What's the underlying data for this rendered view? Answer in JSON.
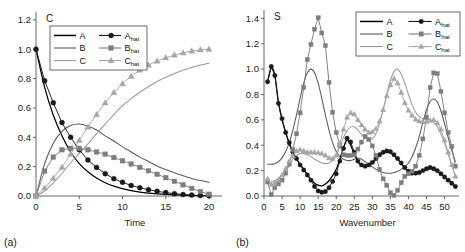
{
  "figure": {
    "panels": [
      {
        "id": "a",
        "corner_label": "(a)",
        "axis_letter": "C",
        "xlabel": "Time",
        "ylabel": "",
        "xticks": [
          "0",
          "5",
          "10",
          "15",
          "20"
        ],
        "yticks": [
          "0.0",
          "0.2",
          "0.4",
          "0.6",
          "0.8",
          "1.0",
          "1.2"
        ],
        "legend": [
          "A",
          "B",
          "C",
          "A_hat",
          "B_hat",
          "C_hat"
        ]
      },
      {
        "id": "b",
        "corner_label": "(b)",
        "axis_letter": "S",
        "xlabel": "Wavenumber",
        "ylabel": "",
        "xticks": [
          "0",
          "5",
          "10",
          "15",
          "20",
          "25",
          "30",
          "35",
          "40",
          "45",
          "50"
        ],
        "yticks": [
          "0.0",
          "0.2",
          "0.4",
          "0.6",
          "0.8",
          "1.0",
          "1.2",
          "1.4"
        ],
        "legend": [
          "A",
          "B",
          "C",
          "A_hat",
          "B_hat",
          "C_hat"
        ]
      }
    ],
    "legend_labels": {
      "a": "A",
      "b": "B",
      "c": "C",
      "ahat_base": "A",
      "bhat_base": "B",
      "chat_base": "C",
      "hat_sub": "hat"
    },
    "colors": {
      "A": "#000000",
      "B": "#5a5a5a",
      "C": "#9a9a9a",
      "Ahat": "#1a1a1a",
      "Bhat": "#7d7d7d",
      "Chat": "#a6a6a6",
      "axis": "#555555",
      "text": "#1a1a1a",
      "background": "#ffffff"
    }
  },
  "chart_data": [
    {
      "type": "line",
      "panel": "a",
      "title": "",
      "subtitle": "",
      "xlabel": "Time",
      "ylabel": "C",
      "xlim": [
        0,
        21.5
      ],
      "ylim": [
        0.0,
        1.24
      ],
      "xticks": [
        0,
        5,
        10,
        15,
        20
      ],
      "yticks": [
        0.0,
        0.2,
        0.4,
        0.6,
        0.8,
        1.0,
        1.2
      ],
      "grid": false,
      "legend_position": "top-center",
      "x": [
        0,
        1,
        2,
        3,
        4,
        5,
        6,
        7,
        8,
        9,
        10,
        11,
        12,
        13,
        14,
        15,
        16,
        17,
        18,
        19,
        20
      ],
      "series": [
        {
          "name": "A",
          "style": "line",
          "color": "#000000",
          "values": [
            1.0,
            0.74,
            0.55,
            0.41,
            0.3,
            0.22,
            0.165,
            0.122,
            0.09,
            0.067,
            0.05,
            0.037,
            0.027,
            0.02,
            0.015,
            0.011,
            0.008,
            0.006,
            0.004,
            0.003,
            0.002
          ]
        },
        {
          "name": "B",
          "style": "line",
          "color": "#5a5a5a",
          "values": [
            0.0,
            0.22,
            0.36,
            0.44,
            0.48,
            0.49,
            0.475,
            0.45,
            0.41,
            0.375,
            0.335,
            0.3,
            0.265,
            0.235,
            0.205,
            0.18,
            0.158,
            0.138,
            0.12,
            0.105,
            0.093
          ]
        },
        {
          "name": "C",
          "style": "line",
          "color": "#9a9a9a",
          "values": [
            0.0,
            0.035,
            0.09,
            0.155,
            0.225,
            0.29,
            0.355,
            0.425,
            0.49,
            0.555,
            0.615,
            0.663,
            0.707,
            0.745,
            0.78,
            0.809,
            0.834,
            0.856,
            0.876,
            0.892,
            0.905
          ]
        },
        {
          "name": "A_hat",
          "style": "line+marker",
          "marker": "circle",
          "color": "#1a1a1a",
          "values": [
            1.0,
            0.785,
            0.635,
            0.5,
            0.4,
            0.315,
            0.245,
            0.195,
            0.152,
            0.118,
            0.093,
            0.072,
            0.056,
            0.043,
            0.032,
            0.023,
            0.016,
            0.01,
            0.006,
            0.003,
            0.002
          ]
        },
        {
          "name": "B_hat",
          "style": "line+marker",
          "marker": "square",
          "color": "#7d7d7d",
          "values": [
            0.0,
            0.17,
            0.265,
            0.315,
            0.325,
            0.325,
            0.315,
            0.3,
            0.285,
            0.262,
            0.24,
            0.218,
            0.195,
            0.172,
            0.148,
            0.125,
            0.1,
            0.076,
            0.052,
            0.03,
            0.012
          ]
        },
        {
          "name": "C_hat",
          "style": "line+marker",
          "marker": "triangle",
          "color": "#a6a6a6",
          "values": [
            0.0,
            0.055,
            0.12,
            0.195,
            0.285,
            0.38,
            0.47,
            0.555,
            0.635,
            0.705,
            0.765,
            0.815,
            0.858,
            0.892,
            0.92,
            0.942,
            0.96,
            0.975,
            0.988,
            0.996,
            1.0
          ]
        }
      ]
    },
    {
      "type": "line",
      "panel": "b",
      "title": "",
      "subtitle": "",
      "xlabel": "Wavenumber",
      "ylabel": "S",
      "xlim": [
        0,
        54
      ],
      "ylim": [
        0.0,
        1.45
      ],
      "xticks": [
        0,
        5,
        10,
        15,
        20,
        25,
        30,
        35,
        40,
        45,
        50
      ],
      "yticks": [
        0.0,
        0.2,
        0.4,
        0.6,
        0.8,
        1.0,
        1.2,
        1.4
      ],
      "grid": false,
      "legend_position": "top-right",
      "x": [
        1,
        2,
        3,
        4,
        5,
        6,
        7,
        8,
        9,
        10,
        11,
        12,
        13,
        14,
        15,
        16,
        17,
        18,
        19,
        20,
        21,
        22,
        23,
        24,
        25,
        26,
        27,
        28,
        29,
        30,
        31,
        32,
        33,
        34,
        35,
        36,
        37,
        38,
        39,
        40,
        41,
        42,
        43,
        44,
        45,
        46,
        47,
        48,
        49,
        50,
        51,
        52,
        53
      ],
      "series": [
        {
          "name": "A",
          "style": "line",
          "color": "#000000",
          "values": [
            0.9,
            1.01,
            0.95,
            0.74,
            0.6,
            0.5,
            0.41,
            0.34,
            0.29,
            0.25,
            0.21,
            0.17,
            0.13,
            0.1,
            0.085,
            0.08,
            0.095,
            0.12,
            0.16,
            0.21,
            0.29,
            0.38,
            0.44,
            0.4,
            0.33,
            0.27,
            0.24,
            0.23,
            0.24,
            0.26,
            0.29,
            0.32,
            0.34,
            0.345,
            0.34,
            0.32,
            0.29,
            0.255,
            0.22,
            0.195,
            0.185,
            0.185,
            0.19,
            0.2,
            0.21,
            0.215,
            0.21,
            0.195,
            0.175,
            0.15,
            0.125,
            0.1,
            0.075
          ]
        },
        {
          "name": "B",
          "style": "line",
          "color": "#5a5a5a",
          "values": [
            0.25,
            0.25,
            0.255,
            0.27,
            0.3,
            0.35,
            0.42,
            0.52,
            0.64,
            0.77,
            0.89,
            0.97,
            1.0,
            0.97,
            0.89,
            0.77,
            0.64,
            0.52,
            0.42,
            0.35,
            0.31,
            0.29,
            0.28,
            0.28,
            0.29,
            0.3,
            0.29,
            0.27,
            0.25,
            0.23,
            0.21,
            0.195,
            0.185,
            0.18,
            0.18,
            0.185,
            0.195,
            0.21,
            0.23,
            0.26,
            0.31,
            0.38,
            0.47,
            0.58,
            0.68,
            0.745,
            0.765,
            0.74,
            0.67,
            0.57,
            0.46,
            0.36,
            0.27
          ]
        },
        {
          "name": "C",
          "style": "line",
          "color": "#9a9a9a",
          "values": [
            0.105,
            0.11,
            0.12,
            0.14,
            0.165,
            0.2,
            0.245,
            0.29,
            0.32,
            0.335,
            0.335,
            0.325,
            0.31,
            0.29,
            0.275,
            0.26,
            0.255,
            0.26,
            0.28,
            0.32,
            0.39,
            0.46,
            0.515,
            0.545,
            0.545,
            0.52,
            0.485,
            0.455,
            0.44,
            0.45,
            0.49,
            0.57,
            0.68,
            0.8,
            0.91,
            0.98,
            1.0,
            0.96,
            0.89,
            0.8,
            0.72,
            0.66,
            0.625,
            0.61,
            0.605,
            0.6,
            0.58,
            0.545,
            0.49,
            0.42,
            0.33,
            0.24,
            0.155
          ]
        },
        {
          "name": "A_hat",
          "style": "line+marker",
          "marker": "circle",
          "color": "#1a1a1a",
          "values": [
            0.9,
            1.02,
            0.95,
            0.73,
            0.61,
            0.5,
            0.42,
            0.345,
            0.295,
            0.245,
            0.205,
            0.165,
            0.125,
            0.075,
            0.04,
            0.03,
            0.035,
            0.065,
            0.115,
            0.175,
            0.275,
            0.375,
            0.455,
            0.425,
            0.345,
            0.275,
            0.245,
            0.235,
            0.245,
            0.265,
            0.295,
            0.325,
            0.345,
            0.355,
            0.35,
            0.325,
            0.295,
            0.26,
            0.225,
            0.195,
            0.18,
            0.18,
            0.185,
            0.2,
            0.215,
            0.225,
            0.215,
            0.2,
            0.175,
            0.15,
            0.125,
            0.1,
            0.075
          ]
        },
        {
          "name": "B_hat",
          "style": "line+marker",
          "marker": "square",
          "color": "#7d7d7d",
          "values": [
            0.11,
            0.01,
            0.065,
            0.095,
            0.125,
            0.18,
            0.25,
            0.365,
            0.49,
            0.655,
            0.855,
            1.075,
            1.195,
            1.315,
            1.405,
            1.285,
            1.185,
            0.895,
            0.66,
            0.5,
            0.4,
            0.325,
            0.32,
            0.32,
            0.325,
            0.37,
            0.425,
            0.47,
            0.445,
            0.395,
            0.32,
            0.21,
            0.135,
            0.085,
            0.025,
            0.005,
            0.045,
            0.105,
            0.155,
            0.175,
            0.195,
            0.235,
            0.32,
            0.45,
            0.62,
            0.855,
            0.97,
            0.965,
            0.825,
            0.655,
            0.5,
            0.39,
            0.235
          ]
        },
        {
          "name": "C_hat",
          "style": "line+marker",
          "marker": "triangle",
          "color": "#a6a6a6",
          "values": [
            0.135,
            0.09,
            0.1,
            0.125,
            0.165,
            0.215,
            0.275,
            0.315,
            0.355,
            0.365,
            0.355,
            0.345,
            0.345,
            0.345,
            0.34,
            0.335,
            0.32,
            0.3,
            0.295,
            0.32,
            0.41,
            0.525,
            0.62,
            0.655,
            0.645,
            0.6,
            0.56,
            0.525,
            0.5,
            0.505,
            0.53,
            0.59,
            0.68,
            0.79,
            0.875,
            0.925,
            0.89,
            0.815,
            0.735,
            0.675,
            0.635,
            0.605,
            0.59,
            0.585,
            0.585,
            0.595,
            0.6,
            0.575,
            0.525,
            0.44,
            0.345,
            0.245,
            0.155
          ]
        }
      ]
    }
  ]
}
